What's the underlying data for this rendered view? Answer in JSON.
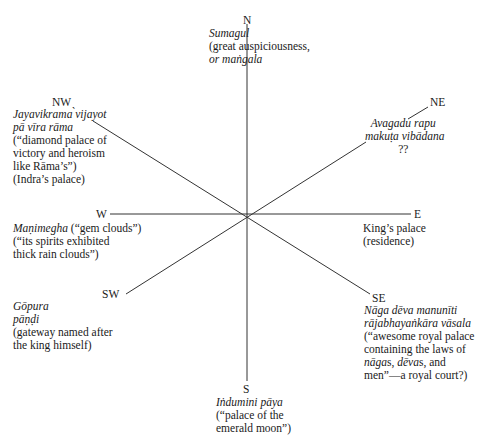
{
  "directions": {
    "N": {
      "label": "N",
      "name": "Sumagul",
      "lines": [
        "(great auspiciousness,",
        "or maṅgala"
      ]
    },
    "NE": {
      "label": "NE",
      "name_lines": [
        "Avagadu rapu",
        "makuṭa vibādana"
      ],
      "lines": [
        "??"
      ]
    },
    "E": {
      "label": "E",
      "lines": [
        "King’s palace",
        "(residence)"
      ]
    },
    "SE": {
      "label": "SE",
      "name_lines": [
        "Nāga dēva manunīti",
        "rājabhayaṅkāra vāsala"
      ],
      "lines": [
        "(“awesome royal palace",
        "containing the laws of"
      ],
      "mixed_line": {
        "part1": "nāga",
        "part2": "s, ",
        "part3": "dēva",
        "part4": "s, and"
      },
      "last_line": "men”—a royal court?)"
    },
    "S": {
      "label": "S",
      "name": "Iṅdumini pāya",
      "lines": [
        "(“palace of the",
        "emerald moon”)"
      ]
    },
    "SW": {
      "label": "SW",
      "name_lines": [
        "Gōpura",
        "pāṇḍi"
      ],
      "lines": [
        "(gateway named after",
        "the king himself)"
      ]
    },
    "W": {
      "label": "W",
      "name": "Maṇimegha",
      "name_suffix": " (“gem clouds”)",
      "lines": [
        "(“its spirits exhibited",
        "thick rain clouds”)"
      ]
    },
    "NW": {
      "label": "NW",
      "name_lines": [
        "Jayavikrama ̀vijayot",
        "pā vīra rāma"
      ],
      "lines": [
        "(“diamond palace of",
        "victory and heroism",
        "like Rāma’s”)",
        "(Indra’s palace)"
      ]
    }
  },
  "colors": {
    "line": "#333333",
    "text": "#1a1a1a"
  }
}
